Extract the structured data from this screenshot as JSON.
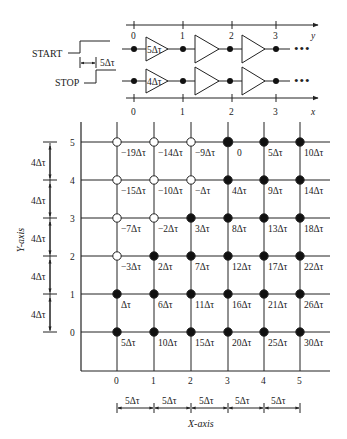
{
  "circuit": {
    "start_label": "START",
    "stop_label": "STOP",
    "offset_label": "5Δτ",
    "top_axis": {
      "ticks": [
        "0",
        "1",
        "2",
        "3"
      ],
      "label": "y"
    },
    "bottom_axis": {
      "ticks": [
        "0",
        "1",
        "2",
        "3"
      ],
      "label": "x"
    },
    "top_buffer_delay": "5Δτ",
    "bottom_buffer_delay": "4Δτ",
    "ellipsis": "•••"
  },
  "grid": {
    "y_axis_title": "Y-axis",
    "x_axis_title": "X-axis",
    "y_ticks": [
      "5",
      "4",
      "3",
      "2",
      "1",
      "0"
    ],
    "x_ticks": [
      "0",
      "1",
      "2",
      "3",
      "4",
      "5"
    ],
    "y_spacing_label": "4Δτ",
    "x_spacing_label": "5Δτ",
    "rows": [
      {
        "y": "5",
        "values": [
          "-19Δτ",
          "-14Δτ",
          "-9Δτ",
          "0",
          "5Δτ",
          "10Δτ"
        ],
        "filled": [
          false,
          false,
          false,
          true,
          true,
          true
        ]
      },
      {
        "y": "4",
        "values": [
          "-15Δτ",
          "-10Δτ",
          "-Δτ",
          "4Δτ",
          "9Δτ",
          "14Δτ"
        ],
        "filled": [
          false,
          false,
          false,
          true,
          true,
          true
        ]
      },
      {
        "y": "3",
        "values": [
          "-7Δτ",
          "-2Δτ",
          "3Δτ",
          "8Δτ",
          "13Δτ",
          "18Δτ"
        ],
        "filled": [
          false,
          false,
          true,
          true,
          true,
          true
        ]
      },
      {
        "y": "2",
        "values": [
          "-3Δτ",
          "2Δτ",
          "7Δτ",
          "12Δτ",
          "17Δτ",
          "22Δτ"
        ],
        "filled": [
          false,
          true,
          true,
          true,
          true,
          true
        ]
      },
      {
        "y": "1",
        "values": [
          "Δτ",
          "6Δτ",
          "11Δτ",
          "16Δτ",
          "21Δτ",
          "26Δτ"
        ],
        "filled": [
          true,
          true,
          true,
          true,
          true,
          true
        ]
      },
      {
        "y": "0",
        "values": [
          "5Δτ",
          "10Δτ",
          "15Δτ",
          "20Δτ",
          "25Δτ",
          "30Δτ"
        ],
        "filled": [
          true,
          true,
          true,
          true,
          true,
          true
        ]
      }
    ]
  }
}
